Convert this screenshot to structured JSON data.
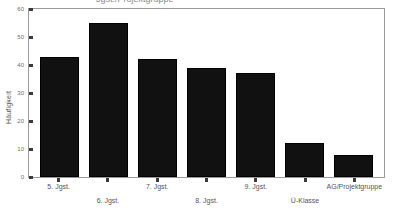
{
  "chart": {
    "title_cutoff": "Jgst./Projektgruppe",
    "ylabel": "Häufigkeit"
  },
  "chart_data": {
    "type": "bar",
    "title": "",
    "xlabel": "",
    "ylabel": "Häufigkeit",
    "ylim": [
      0,
      60
    ],
    "yticks": [
      0,
      10,
      20,
      30,
      40,
      50,
      60
    ],
    "grid": false,
    "legend": "none",
    "bar_color": "#111111",
    "categories": [
      "5. Jgst.",
      "6. Jgst.",
      "7. Jgst.",
      "8. Jgst.",
      "9. Jgst.",
      "Ü-Klasse",
      "AG/Projektgruppe"
    ],
    "values": [
      43,
      55,
      42,
      39,
      37,
      12,
      8
    ]
  }
}
